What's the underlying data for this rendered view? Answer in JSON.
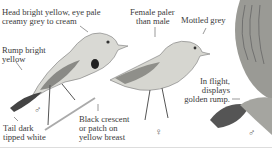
{
  "illustration": {
    "subject": "bird-field-guide-plate",
    "labels": {
      "head": "Head bright yellow, eye pale creamy grey to cream",
      "head_line1": "Head bright yellow, eye pale",
      "head_line2": "creamy grey to cream",
      "rump_line1": "Rump bright",
      "rump_line2": "yellow",
      "female_line1": "Female paler",
      "female_line2": "than male",
      "mottled": "Mottled grey",
      "flight_line1": "In flight,",
      "flight_line2": "displays",
      "flight_line3": "golden rump.",
      "tail_line1": "Tail dark",
      "tail_line2": "tipped white",
      "crescent_line1": "Black crescent",
      "crescent_line2": "or patch on",
      "crescent_line3": "yellow breast"
    },
    "symbols": {
      "male_left": "♂",
      "female": "♀",
      "male_right": "♂"
    },
    "colors": {
      "text": "#3a3a3a",
      "bird_body": "#d9d9d4",
      "bird_dark": "#555555",
      "background": "#ffffff"
    }
  }
}
